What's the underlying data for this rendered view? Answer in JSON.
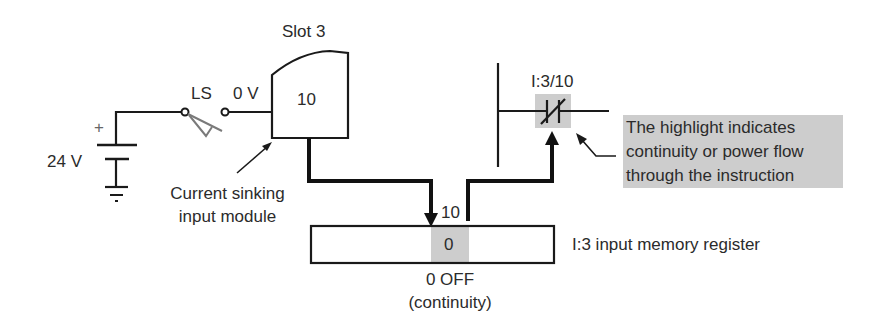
{
  "diagram": {
    "power_supply": {
      "voltage_label": "24 V",
      "polarity_label": "+"
    },
    "switch": {
      "label": "LS",
      "terminal_voltage": "0 V"
    },
    "module": {
      "slot_label": "Slot 3",
      "terminal_number": "10",
      "caption_line1": "Current sinking",
      "caption_line2": "input module"
    },
    "register": {
      "bit_label": "10",
      "bit_value": "0",
      "state_line1": "0 OFF",
      "state_line2": "(continuity)",
      "name": "I:3 input memory register"
    },
    "ladder": {
      "contact_address": "I:3/10",
      "contact_type": "normally-closed"
    },
    "callout": {
      "line1": "The highlight indicates",
      "line2": "continuity or power flow",
      "line3": "through the instruction"
    },
    "colors": {
      "highlight": "#cdcdcd",
      "line": "#1a1a1a",
      "switch_blade": "#7a7a7a"
    }
  }
}
